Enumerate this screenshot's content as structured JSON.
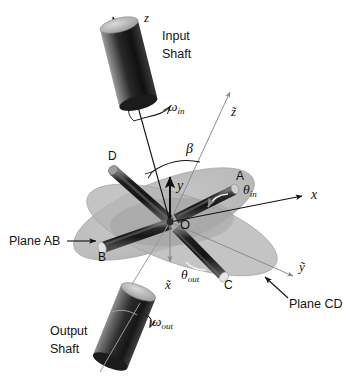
{
  "figure": {
    "background": "#ffffff",
    "colors": {
      "plane_fill": "#b9b9b9",
      "plane_fill_light": "#c9c9c9",
      "plane_stroke": "#a0a0a0",
      "rod_dark": "#232323",
      "rod_mid": "#5a5a5a",
      "rod_light": "#d6d6d6",
      "axis_line": "#111111",
      "axis_line_light": "#8c8c8c",
      "text": "#111111"
    }
  },
  "labels": {
    "z_axis": "z",
    "z_tilde_axis": "z̃",
    "y_axis": "y",
    "x_axis": "x",
    "x_tilde_axis": "x̃",
    "y_tilde_axis": "ỹ",
    "origin": "O",
    "beta": "β",
    "input_shaft_line1": "Input",
    "input_shaft_line2": "Shaft",
    "output_shaft_line1": "Output",
    "output_shaft_line2": "Shaft",
    "plane_ab": "Plane AB",
    "plane_cd": "Plane CD",
    "point_a": "A",
    "point_b": "B",
    "point_c": "C",
    "point_d": "D",
    "omega_in_base": "ω",
    "omega_in_sub": "in",
    "omega_out_base": "ω",
    "omega_out_sub": "out",
    "theta_in_base": "θ",
    "theta_in_sub": "in",
    "theta_out_base": "θ",
    "theta_out_sub": "out"
  },
  "geometry": {
    "origin_px": [
      170,
      222
    ],
    "z_axis_tip_px": [
      111,
      14
    ],
    "z_tilde_tip_px": [
      229,
      90
    ],
    "y_axis_tip_px": [
      170,
      175
    ],
    "x_axis_tip_px": [
      305,
      196
    ],
    "x_tilde_tip_px": [
      158,
      266
    ],
    "y_tilde_tip_px": [
      296,
      278
    ],
    "rod_a_tip_px": [
      236,
      189
    ],
    "rod_b_tip_px": [
      100,
      249
    ],
    "rod_c_tip_px": [
      226,
      278
    ],
    "rod_d_tip_px": [
      113,
      170
    ],
    "beta_angle_deg": 28,
    "input_cylinder_center_px": [
      128,
      63
    ],
    "output_cylinder_center_px": [
      124,
      326
    ]
  }
}
